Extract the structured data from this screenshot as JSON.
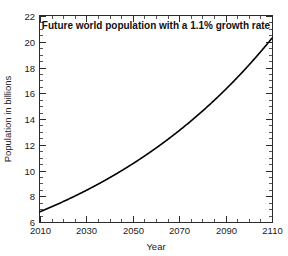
{
  "chart_data": {
    "type": "line",
    "title": "Future world population with a 1.1% growth rate",
    "xlabel": "Year",
    "ylabel": "Population in billions",
    "xlim": [
      2010,
      2110
    ],
    "ylim": [
      6,
      22
    ],
    "xticks": [
      2010,
      2030,
      2050,
      2070,
      2090,
      2110
    ],
    "xticklabels": [
      "2010",
      "2030",
      "2050",
      "2070",
      "2090",
      "2110"
    ],
    "yticks": [
      6,
      8,
      10,
      12,
      14,
      16,
      18,
      20,
      22
    ],
    "yticklabels": [
      "6",
      "8",
      "10",
      "12",
      "14",
      "16",
      "18",
      "20",
      "22"
    ],
    "x_minor_tick_interval": 5,
    "y_minor_tick_interval": 0.5,
    "grid": false,
    "legend": null,
    "series": [
      {
        "name": "World population (1.1% growth)",
        "color": "#000000",
        "formula": "P(t) = 6.8 * 1.011^(t - 2010)",
        "x": [
          2010,
          2015,
          2020,
          2025,
          2030,
          2035,
          2040,
          2045,
          2050,
          2055,
          2060,
          2065,
          2070,
          2075,
          2080,
          2085,
          2090,
          2095,
          2100,
          2105,
          2110
        ],
        "values": [
          6.8,
          7.18,
          7.59,
          8.01,
          8.46,
          8.94,
          9.44,
          9.97,
          10.53,
          11.12,
          11.74,
          12.4,
          13.1,
          13.83,
          14.61,
          15.43,
          16.3,
          17.21,
          18.18,
          19.2,
          20.28
        ]
      }
    ]
  },
  "axis_labels": {
    "x": "Year",
    "y": "Population in billions"
  },
  "title_text": "Future world population with a 1.1% growth rate"
}
